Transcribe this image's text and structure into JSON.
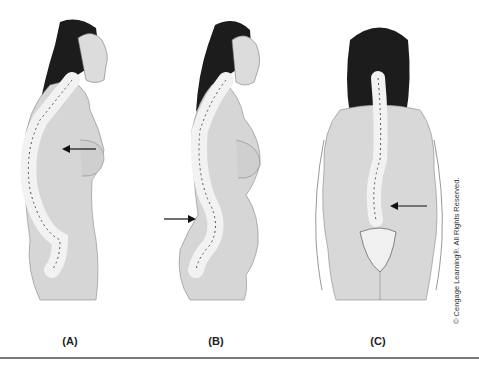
{
  "figure": {
    "panels": [
      {
        "id": "A",
        "label": "(A)",
        "view": "side",
        "spine_curve": "kyphosis",
        "arrow_region": "thoracic"
      },
      {
        "id": "B",
        "label": "(B)",
        "view": "side",
        "spine_curve": "lordosis",
        "arrow_region": "lumbar"
      },
      {
        "id": "C",
        "label": "(C)",
        "view": "back",
        "spine_curve": "scoliosis",
        "arrow_region": "lumbar"
      }
    ],
    "copyright": "© Cengage Learning®. All Rights Reserved."
  },
  "colors": {
    "hair": "#1c1c1c",
    "skin": "#d9d9d9",
    "skin_shade": "#a9a9a9",
    "bone": "#f2f2f2",
    "bone_outline": "#555555",
    "arrow": "#111111",
    "rule": "#7a7a7a"
  }
}
